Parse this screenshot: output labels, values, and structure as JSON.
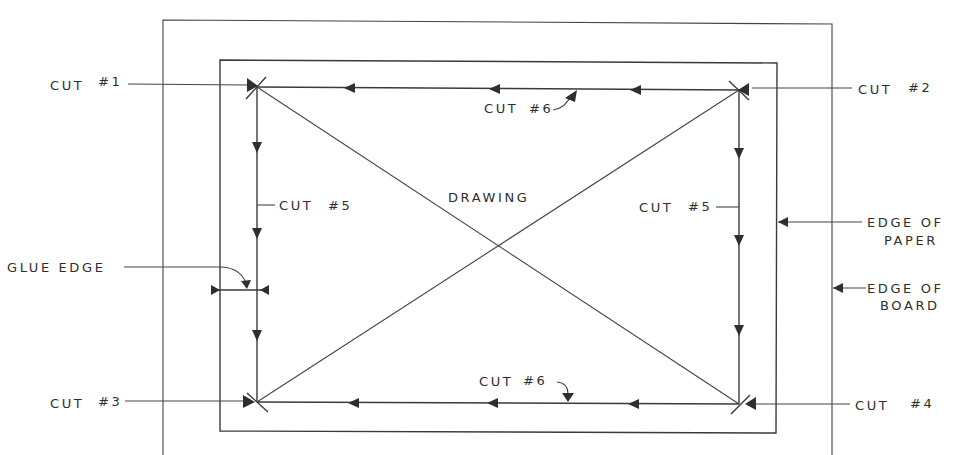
{
  "diagram": {
    "type": "technical-drawing",
    "center_label": "DRAWING",
    "labels": {
      "cut1": {
        "text": "CUT",
        "num": "#1"
      },
      "cut2": {
        "text": "CUT",
        "num": "#2"
      },
      "cut3": {
        "text": "CUT",
        "num": "#3"
      },
      "cut4": {
        "text": "CUT",
        "num": "#4"
      },
      "cut5_left": {
        "text": "CUT",
        "num": "#5"
      },
      "cut5_right": {
        "text": "CUT",
        "num": "#5"
      },
      "cut6_top": {
        "text": "CUT",
        "num": "#6"
      },
      "cut6_bottom": {
        "text": "CUT",
        "num": "#6"
      },
      "glue_edge": "GLUE EDGE",
      "edge_of_paper_1": "EDGE OF",
      "edge_of_paper_2": "PAPER",
      "edge_of_board_1": "EDGE OF",
      "edge_of_board_2": "BOARD"
    },
    "colors": {
      "ink": "#2e2e2e",
      "background": "#ffffff"
    }
  }
}
